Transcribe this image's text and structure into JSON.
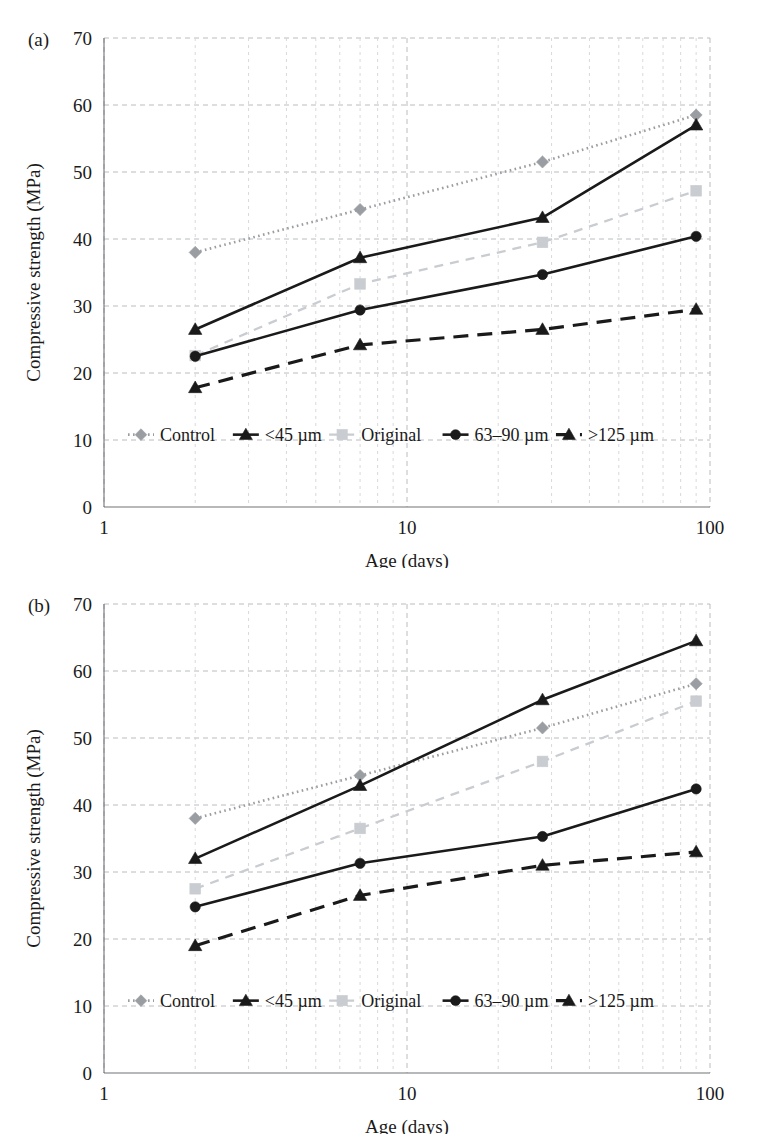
{
  "figure": {
    "panels": [
      {
        "panel_label": "(a)",
        "legend_entries": [
          "Control",
          "<45 µm",
          "Original",
          "63–90 µm",
          ">125 µm"
        ]
      },
      {
        "panel_label": "(b)",
        "legend_entries": [
          "Control",
          "<45 µm",
          "Original",
          "63–90 µm",
          ">125 µm"
        ]
      }
    ]
  },
  "chart_data": [
    {
      "type": "line",
      "panel": "(a)",
      "title": "",
      "xlabel": "Age (days)",
      "ylabel": "Compressive strength (MPa)",
      "xscale": "log",
      "xlim": [
        1,
        100
      ],
      "ylim": [
        0,
        70
      ],
      "xticks": [
        1,
        10,
        100
      ],
      "xticklabels": [
        "1",
        "10",
        "100"
      ],
      "yticks": [
        0,
        10,
        20,
        30,
        40,
        50,
        60,
        70
      ],
      "yticklabels": [
        "0",
        "10",
        "20",
        "30",
        "40",
        "50",
        "60",
        "70"
      ],
      "grid": true,
      "legend_position": "inside-bottom",
      "x": [
        2,
        7,
        28,
        90
      ],
      "series": [
        {
          "name": "Control",
          "values": [
            38.0,
            44.4,
            51.5,
            58.5
          ],
          "marker": "diamond",
          "linestyle": "dotted",
          "color": "#9a9da1"
        },
        {
          "name": "<45 µm",
          "values": [
            26.5,
            37.2,
            43.2,
            57.0
          ],
          "marker": "triangle",
          "linestyle": "solid",
          "color": "#1a1a1a"
        },
        {
          "name": "Original",
          "values": [
            22.6,
            33.3,
            39.5,
            47.2
          ],
          "marker": "square",
          "linestyle": "dashed",
          "color": "#c9ccd0"
        },
        {
          "name": "63–90 µm",
          "values": [
            22.5,
            29.4,
            34.7,
            40.4
          ],
          "marker": "circle",
          "linestyle": "solid",
          "color": "#1a1a1a"
        },
        {
          "name": ">125 µm",
          "values": [
            17.8,
            24.2,
            26.5,
            29.5
          ],
          "marker": "triangle",
          "linestyle": "longdash",
          "color": "#1a1a1a"
        }
      ]
    },
    {
      "type": "line",
      "panel": "(b)",
      "title": "",
      "xlabel": "Age (days)",
      "ylabel": "Compressive strength (MPa)",
      "xscale": "log",
      "xlim": [
        1,
        100
      ],
      "ylim": [
        0,
        70
      ],
      "xticks": [
        1,
        10,
        100
      ],
      "xticklabels": [
        "1",
        "10",
        "100"
      ],
      "yticks": [
        0,
        10,
        20,
        30,
        40,
        50,
        60,
        70
      ],
      "yticklabels": [
        "0",
        "10",
        "20",
        "30",
        "40",
        "50",
        "60",
        "70"
      ],
      "grid": true,
      "legend_position": "inside-bottom",
      "x": [
        2,
        7,
        28,
        90
      ],
      "series": [
        {
          "name": "Control",
          "values": [
            38.0,
            44.4,
            51.5,
            58.1
          ],
          "marker": "diamond",
          "linestyle": "dotted",
          "color": "#9a9da1"
        },
        {
          "name": "<45 µm",
          "values": [
            32.0,
            42.9,
            55.7,
            64.5
          ],
          "marker": "triangle",
          "linestyle": "solid",
          "color": "#1a1a1a"
        },
        {
          "name": "Original",
          "values": [
            27.5,
            36.5,
            46.5,
            55.5
          ],
          "marker": "square",
          "linestyle": "dashed",
          "color": "#c9ccd0"
        },
        {
          "name": "63–90 µm",
          "values": [
            24.8,
            31.3,
            35.3,
            42.4
          ],
          "marker": "circle",
          "linestyle": "solid",
          "color": "#1a1a1a"
        },
        {
          "name": ">125 µm",
          "values": [
            19.0,
            26.5,
            31.0,
            33.0
          ],
          "marker": "triangle",
          "linestyle": "longdash",
          "color": "#1a1a1a"
        }
      ]
    }
  ]
}
